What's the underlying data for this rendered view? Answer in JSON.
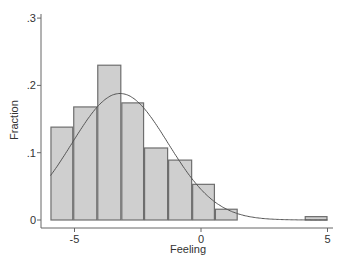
{
  "chart_data": {
    "type": "bar",
    "subtype": "histogram_with_normal_overlay",
    "title": "",
    "xlabel": "Feeling",
    "ylabel": "Fraction",
    "xlim": [
      -6.0,
      5.4
    ],
    "ylim": [
      0,
      0.3
    ],
    "x_ticks": [
      -5,
      0,
      5
    ],
    "x_tick_labels": [
      "-5",
      "0",
      "5"
    ],
    "y_ticks": [
      0,
      0.1,
      0.2,
      0.3
    ],
    "y_tick_labels": [
      "0",
      ".1",
      ".2",
      ".3"
    ],
    "grid": false,
    "legend": null,
    "bins": [
      {
        "x0": -5.95,
        "x1": -5.05,
        "value": 0.138
      },
      {
        "x0": -5.05,
        "x1": -4.1,
        "value": 0.168
      },
      {
        "x0": -4.1,
        "x1": -3.15,
        "value": 0.23
      },
      {
        "x0": -3.15,
        "x1": -2.25,
        "value": 0.174
      },
      {
        "x0": -2.25,
        "x1": -1.3,
        "value": 0.107
      },
      {
        "x0": -1.3,
        "x1": -0.35,
        "value": 0.089
      },
      {
        "x0": -0.35,
        "x1": 0.55,
        "value": 0.053
      },
      {
        "x0": 0.55,
        "x1": 1.45,
        "value": 0.016
      },
      {
        "x0": 4.1,
        "x1": 5.0,
        "value": 0.005
      }
    ],
    "categories": [
      "-5.5",
      "-4.6",
      "-3.6",
      "-2.7",
      "-1.8",
      "-0.8",
      "0.1",
      "1.0",
      "4.6"
    ],
    "values": [
      0.138,
      0.168,
      0.23,
      0.174,
      0.107,
      0.089,
      0.053,
      0.016,
      0.005
    ],
    "overlay": {
      "type": "normal_density_line",
      "peak_x": -3.2,
      "peak_y": 0.188,
      "sd": 1.9,
      "x_range": [
        -5.95,
        5.0
      ]
    },
    "colors": {
      "bar_fill": "#cfcfcf",
      "bar_stroke": "#6e6e6e",
      "curve": "#555555",
      "axis": "#666666",
      "text": "#333333"
    }
  }
}
